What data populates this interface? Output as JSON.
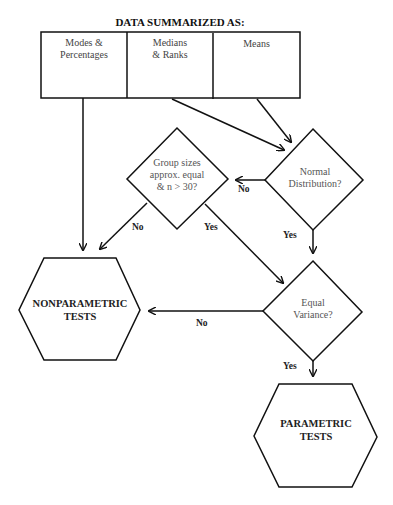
{
  "title": "DATA SUMMARIZED AS:",
  "summary_table": {
    "cells": [
      {
        "label_line1": "Modes &",
        "label_line2": "Percentages"
      },
      {
        "label_line1": "Medians",
        "label_line2": "& Ranks"
      },
      {
        "label_line1": "Means",
        "label_line2": ""
      }
    ]
  },
  "decisions": {
    "normal_distribution": {
      "line1": "Normal",
      "line2": "Distribution?"
    },
    "group_sizes": {
      "line1": "Group sizes",
      "line2": "approx. equal",
      "line3": "& n > 30?"
    },
    "equal_variance": {
      "line1": "Equal",
      "line2": "Variance?"
    }
  },
  "edge_labels": {
    "normal_no": "No",
    "normal_yes": "Yes",
    "group_no": "No",
    "group_yes": "Yes",
    "variance_no": "No",
    "variance_yes": "Yes"
  },
  "outcomes": {
    "nonparametric": {
      "line1": "NONPARAMETRIC",
      "line2": "TESTS"
    },
    "parametric": {
      "line1": "PARAMETRIC",
      "line2": "TESTS"
    }
  }
}
